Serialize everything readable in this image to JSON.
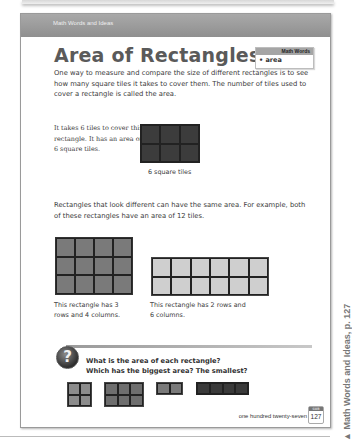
{
  "header": {
    "section_label": "Math Words and Ideas"
  },
  "title": "Area of Rectangles",
  "math_words": {
    "heading": "Math Words",
    "items": [
      "• area"
    ]
  },
  "intro_paragraph": "One way to measure and compare the size of different rectangles is to see how many square tiles it takes to cover them. The number of tiles used to cover a rectangle is called the area.",
  "example": {
    "text": "It takes 6 tiles to cover this rectangle. It has an area of 6 square tiles.",
    "caption": "6 square tiles",
    "rows": 2,
    "cols": 3,
    "color": "#3c3c3c"
  },
  "second_paragraph": "Rectangles that look different can have the same area. For example, both of these rectangles have an area of 12 tiles.",
  "rect_a": {
    "caption": "This rectangle has 3 rows and 4 columns.",
    "rows": 3,
    "cols": 4,
    "color": "#7a7a7a"
  },
  "rect_b": {
    "caption": "This rectangle has 2 rows and 6 columns.",
    "rows": 2,
    "cols": 6,
    "color": "#cfcfcf"
  },
  "question": {
    "icon": "?",
    "line1": "What is the area of each rectangle?",
    "line2": "Which has the biggest area? The smallest?",
    "shapes": [
      {
        "rows": 2,
        "cols": 2,
        "color": "#8c8c8c"
      },
      {
        "rows": 2,
        "cols": 3,
        "color": "#6e6e6e"
      },
      {
        "rows": 1,
        "cols": 2,
        "color": "#7a7a7a"
      },
      {
        "rows": 1,
        "cols": 4,
        "color": "#3a3a3a"
      }
    ]
  },
  "footer": {
    "page_words": "one hundred twenty-seven",
    "badge_label": "SWB",
    "page_number": "127"
  },
  "side_caption": "▲  Math Words and Ideas, p. 127"
}
